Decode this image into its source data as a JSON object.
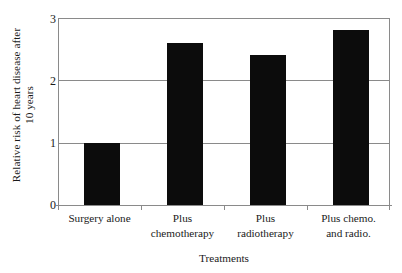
{
  "chart_data": {
    "type": "bar",
    "title": "",
    "subtitle": "",
    "categories": [
      "Surgery alone",
      "Plus chemotherapy",
      "Plus radiotherapy",
      "Plus chemo. and radio."
    ],
    "category_lines": [
      [
        "Surgery alone",
        ""
      ],
      [
        "Plus",
        "chemotherapy"
      ],
      [
        "Plus",
        "radiotherapy"
      ],
      [
        "Plus chemo.",
        "and radio."
      ]
    ],
    "values": [
      1.0,
      2.6,
      2.4,
      2.8
    ],
    "xlabel": "Treatments",
    "ylabel": "Relative risk of heart disease after 10 years",
    "ylabel_lines": [
      "Relative risk of heart disease after",
      "10 years"
    ],
    "ylim": [
      0,
      3
    ],
    "yticks": [
      "0",
      "1",
      "2",
      "3"
    ],
    "ytick_values": [
      0,
      1,
      2,
      3
    ],
    "grid": true,
    "grid_axis": "y",
    "legend": "none",
    "bar_color": "#0c0c0c",
    "axis_color": "#8a8a8a",
    "background_color": "#ffffff"
  }
}
